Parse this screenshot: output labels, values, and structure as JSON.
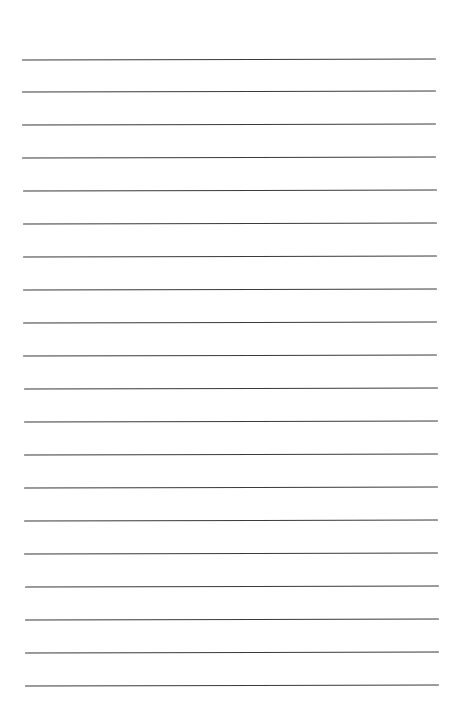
{
  "page": {
    "background": "#ffffff",
    "line_color": "#3a3a3a",
    "line_count": 20,
    "first_line_y": 58.5,
    "line_spacing": 32.95,
    "line_left_top": 22,
    "line_right_top": 436,
    "line_left_bottom": 25,
    "line_right_bottom": 439
  }
}
